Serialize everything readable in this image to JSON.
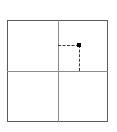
{
  "figure": {
    "title": "",
    "background_color": "#ffffff",
    "width": 117,
    "height": 132
  },
  "frame": {
    "name": "plot-frame",
    "border_color": "#5a5a5a",
    "left": 7,
    "top": 20,
    "width": 101,
    "height": 102
  },
  "axes": {
    "vertical": {
      "color": "#8c8c8c",
      "x": 58,
      "y_start": 20,
      "y_end": 122
    },
    "horizontal": {
      "color": "#8c8c8c",
      "y": 71,
      "x_start": 7,
      "x_end": 108
    }
  },
  "guides": {
    "horizontal": {
      "style": "dashed",
      "color": "#3a3a3a",
      "x_start": 58,
      "x_end": 79,
      "y": 45
    },
    "vertical": {
      "style": "dashed",
      "color": "#3a3a3a",
      "x": 79,
      "y_start": 45,
      "y_end": 71
    }
  },
  "chart_data": {
    "type": "scatter",
    "title": "",
    "xlabel": "",
    "ylabel": "",
    "xlim": [
      -1,
      1
    ],
    "ylim": [
      -1,
      1
    ],
    "grid": true,
    "legend": null,
    "x": [
      0.42
    ],
    "y": [
      0.51
    ],
    "point_color": "#000000",
    "point_marker": "square",
    "annotations": [
      "dashed guide from vertical axis to point",
      "dashed guide from point down to horizontal axis"
    ],
    "quadrants": [
      "upper-left",
      "upper-right",
      "lower-left",
      "lower-right"
    ],
    "point_quadrant": "upper-right"
  }
}
